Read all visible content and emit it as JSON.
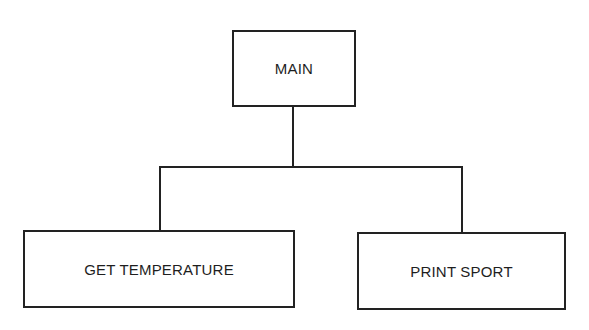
{
  "diagram": {
    "type": "hierarchy-chart",
    "root": {
      "label": "MAIN"
    },
    "children": [
      {
        "label": "GET TEMPERATURE"
      },
      {
        "label": "PRINT SPORT"
      }
    ],
    "edges": [
      {
        "from": "MAIN",
        "to": "GET TEMPERATURE"
      },
      {
        "from": "MAIN",
        "to": "PRINT SPORT"
      }
    ],
    "colors": {
      "line": "#222222",
      "text": "#1e1e1e",
      "background": "#ffffff"
    }
  }
}
